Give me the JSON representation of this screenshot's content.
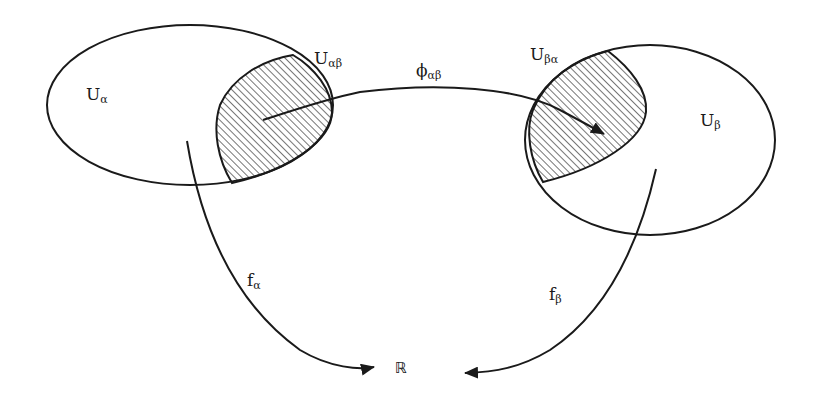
{
  "diagram": {
    "labels": {
      "U_alpha": {
        "base": "U",
        "sub": "α"
      },
      "U_beta": {
        "base": "U",
        "sub": "β"
      },
      "U_alphabeta": {
        "base": "U",
        "sub": "αβ"
      },
      "U_betaalpha": {
        "base": "U",
        "sub": "βα"
      },
      "phi_alphabeta": {
        "base": "ϕ",
        "sub": "αβ"
      },
      "f_alpha": {
        "base": "f",
        "sub": "α"
      },
      "f_beta": {
        "base": "f",
        "sub": "β"
      },
      "reals": "ℝ"
    },
    "colors": {
      "stroke": "#1a1a1a",
      "hatch": "#2a2a2a",
      "background": "#ffffff"
    },
    "nodes": [
      {
        "id": "U_alpha",
        "shape": "ellipse",
        "center": [
          190,
          105
        ],
        "rx": 143,
        "ry": 80
      },
      {
        "id": "U_beta",
        "shape": "ellipse",
        "center": [
          650,
          140
        ],
        "rx": 125,
        "ry": 95
      },
      {
        "id": "U_alphabeta",
        "shape": "hatched-region",
        "inside": "U_alpha"
      },
      {
        "id": "U_betaalpha",
        "shape": "hatched-region",
        "inside": "U_beta"
      },
      {
        "id": "R",
        "shape": "text"
      }
    ],
    "edges": [
      {
        "from": "U_alphabeta",
        "to": "U_betaalpha",
        "label": "ϕαβ"
      },
      {
        "from": "U_alpha",
        "to": "R",
        "label": "fα"
      },
      {
        "from": "U_beta",
        "to": "R",
        "label": "fβ"
      }
    ]
  }
}
